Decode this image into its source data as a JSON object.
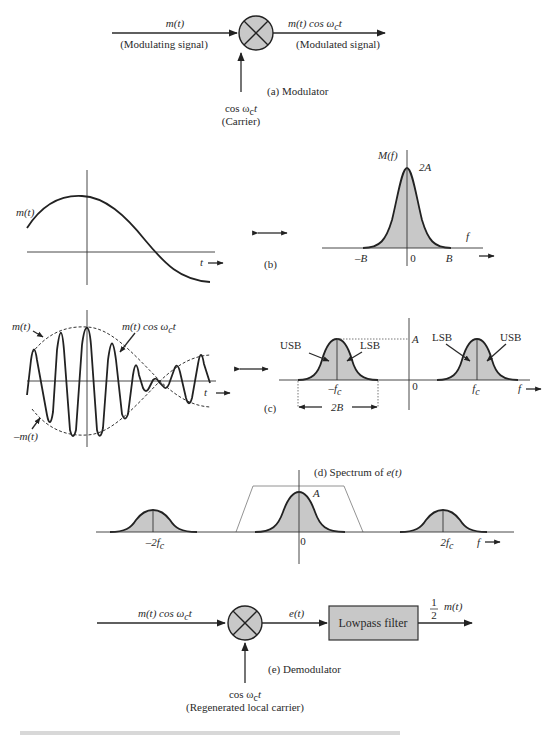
{
  "modulator": {
    "input_label": "m(t)",
    "input_desc": "(Modulating signal)",
    "output_label": "m(t) cos ω",
    "output_sub": "c",
    "output_t": "t",
    "output_desc": "(Modulated signal)",
    "carrier_label": "cos ω",
    "carrier_sub": "c",
    "carrier_t": "t",
    "carrier_desc": "(Carrier)",
    "caption": "(a) Modulator"
  },
  "panel_b": {
    "time_label": "m(t)",
    "t_axis": "t",
    "caption": "(b)",
    "spectrum_label": "M(f)",
    "peak_label": "2A",
    "f_axis": "f",
    "tick_neg": "–B",
    "tick_zero": "0",
    "tick_pos": "B"
  },
  "panel_c": {
    "envelope_pos": "m(t)",
    "envelope_neg": "–m(t)",
    "signal_label": "m(t) cos ω",
    "signal_sub": "c",
    "signal_t": "t",
    "t_axis": "t",
    "caption": "(c)",
    "usb_left": "USB",
    "lsb_left": "LSB",
    "lsb_right": "LSB",
    "usb_right": "USB",
    "peak_label": "A",
    "tick_neg": "–f",
    "tick_neg_sub": "c",
    "tick_zero": "0",
    "tick_pos": "f",
    "tick_pos_sub": "c",
    "f_axis": "f",
    "bandwidth_label": "2B"
  },
  "panel_d": {
    "caption_prefix": "(d) Spectrum of ",
    "caption_var": "e(t)",
    "peak_label": "A",
    "tick_neg": "–2f",
    "tick_neg_sub": "c",
    "tick_zero": "0",
    "tick_pos": "2f",
    "tick_pos_sub": "c",
    "f_axis": "f"
  },
  "demodulator": {
    "input_label": "m(t) cos ω",
    "input_sub": "c",
    "input_t": "t",
    "mixer_output": "e(t)",
    "filter_label": "Lowpass filter",
    "output_num": "1",
    "output_den": "2",
    "output_label": "m(t)",
    "carrier_label": "cos ω",
    "carrier_sub": "c",
    "carrier_t": "t",
    "carrier_desc": "(Regenerated local carrier)",
    "caption": "(e) Demodulator"
  },
  "colors": {
    "ink": "#2a2a2a",
    "fill_gray": "#c8c8c8",
    "background": "#ffffff"
  }
}
